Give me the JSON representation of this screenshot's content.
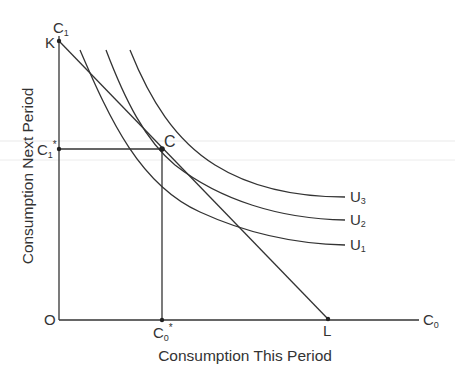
{
  "diagram": {
    "x_axis": {
      "title": "Consumption This Period",
      "end_label": "C",
      "end_label_sub": "0"
    },
    "y_axis": {
      "title": "Consumption Next Period",
      "end_label": "C",
      "end_label_sub": "1"
    },
    "origin_label": "O",
    "points": {
      "K": {
        "label": "K"
      },
      "L": {
        "label": "L"
      },
      "C": {
        "label": "C"
      },
      "C0_star": {
        "label": "C",
        "sub": "0",
        "sup": "*"
      },
      "C1_star": {
        "label": "C",
        "sub": "1",
        "sup": "*"
      }
    },
    "curves": [
      {
        "label": "U",
        "sub": "1"
      },
      {
        "label": "U",
        "sub": "2"
      },
      {
        "label": "U",
        "sub": "3"
      }
    ],
    "colors": {
      "line": "#333333",
      "background": "#ffffff",
      "scan_line": "#e6e6e6"
    }
  }
}
